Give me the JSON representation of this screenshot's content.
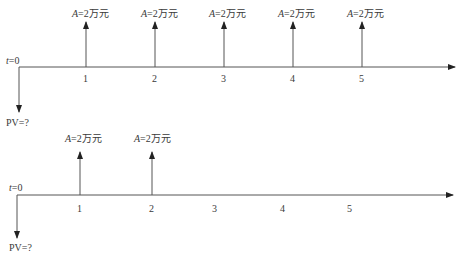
{
  "diagrams": [
    {
      "id": "top",
      "start_label_var": "t",
      "start_label_eq": "=0",
      "pv_label": "PV=?",
      "payment_var": "A",
      "payment_text": "=2万元",
      "periods": [
        "1",
        "2",
        "3",
        "4",
        "5"
      ],
      "payment_periods": [
        "1",
        "2",
        "3",
        "4",
        "5"
      ]
    },
    {
      "id": "bottom",
      "start_label_var": "t",
      "start_label_eq": "=0",
      "pv_label": "PV=?",
      "payment_var": "A",
      "payment_text": "=2万元",
      "periods": [
        "1",
        "2",
        "3",
        "4",
        "5"
      ],
      "payment_periods": [
        "1",
        "2"
      ]
    }
  ],
  "colors": {
    "line": "#555555",
    "text": "#3a3a3a"
  }
}
